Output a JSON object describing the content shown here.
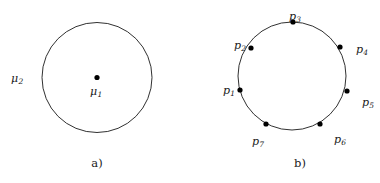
{
  "figure": {
    "background_color": "#ffffff",
    "stroke_color": "#1a1a1a",
    "point_color": "#000000"
  },
  "panel_a": {
    "caption": "a)",
    "circle": {
      "cx": 97,
      "cy": 77.5,
      "r": 55
    },
    "center_point": {
      "cx": 97,
      "cy": 77.5,
      "r": 2.6
    },
    "labels": {
      "center_symbol": "μ",
      "center_subscript": "1",
      "boundary_symbol": "μ",
      "boundary_subscript": "2"
    }
  },
  "panel_b": {
    "caption": "b)",
    "circle": {
      "cx": 102,
      "cy": 76,
      "r": 54
    },
    "points": [
      {
        "id": "p1",
        "symbol": "p",
        "subscript": "1",
        "cx": 50,
        "cy": 90,
        "lx": 33,
        "ly": 85
      },
      {
        "id": "p2",
        "symbol": "p",
        "subscript": "2",
        "cx": 61,
        "cy": 48,
        "lx": 44,
        "ly": 40
      },
      {
        "id": "p3",
        "symbol": "p",
        "subscript": "3",
        "cx": 103,
        "cy": 22,
        "lx": 99,
        "ly": 11
      },
      {
        "id": "p4",
        "symbol": "p",
        "subscript": "4",
        "cx": 150,
        "cy": 47,
        "lx": 166,
        "ly": 44
      },
      {
        "id": "p5",
        "symbol": "p",
        "subscript": "5",
        "cx": 157,
        "cy": 91,
        "lx": 172,
        "ly": 97
      },
      {
        "id": "p6",
        "symbol": "p",
        "subscript": "6",
        "cx": 130,
        "cy": 124,
        "lx": 144,
        "ly": 134
      },
      {
        "id": "p7",
        "symbol": "p",
        "subscript": "7",
        "cx": 76,
        "cy": 124,
        "lx": 62,
        "ly": 136
      }
    ],
    "point_radius": 2.6
  },
  "captions": {
    "a_x": 97,
    "a_y": 163,
    "b_x": 110,
    "b_y": 163
  }
}
